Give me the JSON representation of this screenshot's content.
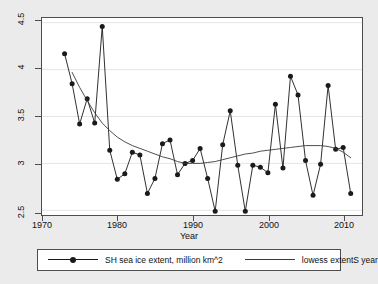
{
  "chart_data": {
    "type": "line",
    "title": "",
    "xlabel": "Year",
    "ylabel": "",
    "xlim": [
      1970,
      2012.5
    ],
    "ylim": [
      2.45,
      4.55
    ],
    "xticks": [
      1970,
      1980,
      1990,
      2000,
      2010
    ],
    "yticks": [
      2.5,
      3,
      3.5,
      4,
      4.5
    ],
    "xtick_labels": [
      "1970",
      "1980",
      "1990",
      "2000",
      "2010"
    ],
    "ytick_labels": [
      "2.5",
      "3",
      "3.5",
      "4",
      "4.5"
    ],
    "grid": "horizontal",
    "legend_position": "below-plot",
    "series": [
      {
        "name": "SH sea ice extent, million km^2",
        "marker": "filled-circle",
        "color": "#1a1a1a",
        "x": [
          1973,
          1974,
          1975,
          1976,
          1977,
          1978,
          1979,
          1980,
          1981,
          1982,
          1983,
          1984,
          1985,
          1986,
          1987,
          1988,
          1989,
          1990,
          1991,
          1992,
          1993,
          1994,
          1995,
          1996,
          1997,
          1998,
          1999,
          2000,
          2001,
          2002,
          2003,
          2004,
          2005,
          2006,
          2007,
          2008,
          2009,
          2010,
          2011
        ],
        "values": [
          4.17,
          3.85,
          3.42,
          3.69,
          3.43,
          4.46,
          3.14,
          2.83,
          2.89,
          3.12,
          3.09,
          2.68,
          2.84,
          3.21,
          3.25,
          2.88,
          3.0,
          3.03,
          3.16,
          2.84,
          2.49,
          3.2,
          3.56,
          2.98,
          2.49,
          2.98,
          2.96,
          2.9,
          3.63,
          2.95,
          3.93,
          3.73,
          3.03,
          2.66,
          2.99,
          3.83,
          3.15,
          3.17,
          2.68
        ]
      },
      {
        "name": "lowess extentS year",
        "marker": "none",
        "color": "#3b3b3b",
        "x": [
          1974,
          1975,
          1976,
          1977,
          1978,
          1979,
          1980,
          1981,
          1982,
          1983,
          1984,
          1985,
          1986,
          1987,
          1988,
          1989,
          1990,
          1991,
          1992,
          1993,
          1994,
          1995,
          1996,
          1997,
          1998,
          1999,
          2000,
          2001,
          2002,
          2003,
          2004,
          2005,
          2006,
          2007,
          2008,
          2009,
          2010,
          2011
        ],
        "values": [
          3.97,
          3.81,
          3.67,
          3.54,
          3.43,
          3.35,
          3.28,
          3.23,
          3.19,
          3.16,
          3.13,
          3.1,
          3.07,
          3.05,
          3.02,
          3.0,
          3.0,
          3.0,
          3.01,
          3.02,
          3.04,
          3.06,
          3.08,
          3.1,
          3.11,
          3.13,
          3.14,
          3.15,
          3.16,
          3.17,
          3.18,
          3.19,
          3.19,
          3.19,
          3.18,
          3.16,
          3.12,
          3.06
        ]
      }
    ]
  },
  "axes": {
    "xlabel": "Year",
    "xtick_labels": [
      "1970",
      "1980",
      "1990",
      "2000",
      "2010"
    ],
    "ytick_labels": [
      "2.5",
      "3",
      "3.5",
      "4",
      "4.5"
    ]
  },
  "legend": {
    "entries": [
      {
        "label": "SH sea ice extent, million km^2"
      },
      {
        "label": "lowess extentS year"
      }
    ]
  }
}
